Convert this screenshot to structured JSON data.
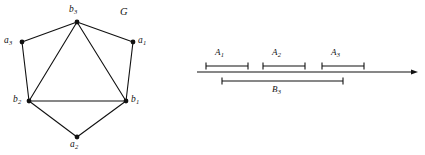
{
  "figure": {
    "name": "graph-and-interval-diagram",
    "stroke_color": "#111111",
    "background_color": "#ffffff"
  },
  "graph": {
    "name_label": "G",
    "vertices": [
      {
        "id": "b3",
        "letter": "b",
        "sub": "3",
        "x": 77,
        "y": 22,
        "label_x": 69,
        "label_y": 5
      },
      {
        "id": "a3",
        "letter": "a",
        "sub": "3",
        "x": 22,
        "y": 42,
        "label_x": 4,
        "label_y": 36
      },
      {
        "id": "a1",
        "letter": "a",
        "sub": "1",
        "x": 133,
        "y": 42,
        "label_x": 138,
        "label_y": 36
      },
      {
        "id": "b2",
        "letter": "b",
        "sub": "2",
        "x": 29,
        "y": 101,
        "label_x": 13,
        "label_y": 95
      },
      {
        "id": "b1",
        "letter": "b",
        "sub": "1",
        "x": 126,
        "y": 101,
        "label_x": 131,
        "label_y": 95
      },
      {
        "id": "a2",
        "letter": "a",
        "sub": "2",
        "x": 77,
        "y": 137,
        "label_x": 70,
        "label_y": 140
      }
    ],
    "edges": [
      {
        "from": "a3",
        "to": "b3"
      },
      {
        "from": "b3",
        "to": "a1"
      },
      {
        "from": "a3",
        "to": "b2"
      },
      {
        "from": "a1",
        "to": "b1"
      },
      {
        "from": "b2",
        "to": "b1"
      },
      {
        "from": "b3",
        "to": "b2"
      },
      {
        "from": "b3",
        "to": "b1"
      },
      {
        "from": "b2",
        "to": "a2"
      },
      {
        "from": "a2",
        "to": "b1"
      }
    ]
  },
  "interval_diagram": {
    "axis": {
      "x1": 197,
      "x2": 418,
      "y": 72,
      "arrow": "right-arrow"
    },
    "intervals": [
      {
        "id": "A1",
        "letter": "A",
        "sub": "1",
        "x1": 206,
        "x2": 248,
        "y": 66,
        "label_x": 215,
        "label_y": 48,
        "position": "above"
      },
      {
        "id": "A2",
        "letter": "A",
        "sub": "2",
        "x1": 263,
        "x2": 305,
        "y": 66,
        "label_x": 272,
        "label_y": 48,
        "position": "above"
      },
      {
        "id": "A3",
        "letter": "A",
        "sub": "3",
        "x1": 322,
        "x2": 364,
        "y": 66,
        "label_x": 331,
        "label_y": 48,
        "position": "above"
      },
      {
        "id": "B3",
        "letter": "B",
        "sub": "3",
        "x1": 222,
        "x2": 343,
        "y": 81,
        "label_x": 272,
        "label_y": 85,
        "position": "below"
      }
    ]
  }
}
